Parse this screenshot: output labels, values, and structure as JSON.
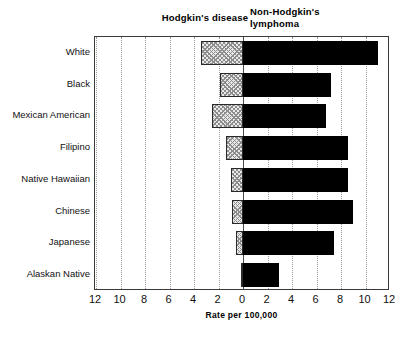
{
  "chart_data": {
    "type": "bar",
    "orientation": "horizontal-diverging",
    "title": "",
    "left_panel_title": "Hodgkin's disease",
    "right_panel_title": "Non-Hodgkin's\nlymphoma",
    "xlabel": "Rate per 100,000",
    "ylabel": "",
    "categories": [
      "White",
      "Black",
      "Mexican American",
      "Filipino",
      "Native Hawaiian",
      "Chinese",
      "Japanese",
      "Alaskan Native"
    ],
    "series": [
      {
        "name": "Hodgkin's disease",
        "direction": "left",
        "fill": "hatched-gray",
        "values": [
          3.4,
          1.9,
          2.5,
          1.4,
          1.0,
          0.9,
          0.6,
          0.2
        ]
      },
      {
        "name": "Non-Hodgkin's lymphoma",
        "direction": "right",
        "fill": "solid-black",
        "values": [
          11.0,
          7.2,
          6.8,
          8.6,
          8.6,
          9.0,
          7.4,
          2.9
        ]
      }
    ],
    "xlim": [
      -12,
      12
    ],
    "xticks": [
      12,
      10,
      8,
      6,
      4,
      2,
      0,
      2,
      4,
      6,
      8,
      10,
      12
    ],
    "xtick_values": [
      -12,
      -10,
      -8,
      -6,
      -4,
      -2,
      0,
      2,
      4,
      6,
      8,
      10,
      12
    ],
    "grid": true,
    "grid_style": "dotted-vertical",
    "legend": "none",
    "colors": {
      "right_bar": "#000000",
      "left_bar_fill": "#e8e8e8",
      "left_bar_hatch": "#8d8d8d",
      "axis": "#3a3a3a",
      "gridline": "#999999",
      "text": "#111111",
      "background": "#ffffff"
    }
  }
}
